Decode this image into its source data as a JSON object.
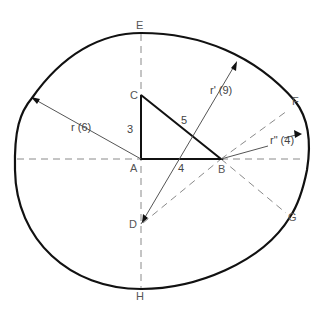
{
  "diagram": {
    "title": "",
    "oval": {
      "description": "Four-centred oval constructed from a 3-4-5 right triangle",
      "stroke": "#111111"
    },
    "points": {
      "A": {
        "label": "A",
        "x": 141,
        "y": 159
      },
      "B": {
        "label": "B",
        "x": 221,
        "y": 159
      },
      "C": {
        "label": "C",
        "x": 141,
        "y": 95
      },
      "D": {
        "label": "D",
        "x": 141,
        "y": 224
      },
      "E": {
        "label": "E",
        "x": 141,
        "y": 23
      },
      "F": {
        "label": "F",
        "x": 295,
        "y": 101
      },
      "G": {
        "label": "G",
        "x": 290,
        "y": 217
      },
      "H": {
        "label": "H",
        "x": 141,
        "y": 297
      }
    },
    "triangle": {
      "sides": {
        "AC": "3",
        "AB": "4",
        "BC": "5"
      }
    },
    "radii": {
      "r": {
        "label": "r (6)",
        "value": 6,
        "from": "A"
      },
      "r_prime": {
        "label": "r' (9)",
        "value": 9,
        "from": "D"
      },
      "r_double_prime": {
        "label": "r\" (4)",
        "value": 4,
        "from": "B"
      }
    },
    "colors": {
      "solid": "#111111",
      "dashed": "#8a8a8a",
      "text": "#444444"
    }
  }
}
